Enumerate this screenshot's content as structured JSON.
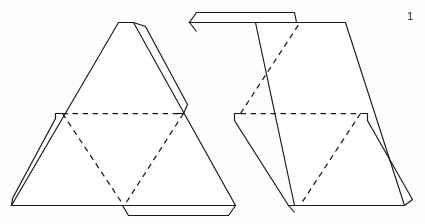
{
  "page": {
    "number_label": "1",
    "background_color": "#fdfdfc",
    "ink_color": "#1a1a1a"
  },
  "figure": {
    "title": "",
    "caption": "",
    "kind": "papercraft-net-line-drawing",
    "line_styles": {
      "cut_label": "solid",
      "fold_label": "dashed"
    },
    "nets": [
      {
        "name": "left-triangle-net",
        "outline_label": "large upright triangle",
        "tabs": [
          {
            "name": "apex-right-strip-tab",
            "edge_label": "upper right edge"
          },
          {
            "name": "lower-left-strip-tab",
            "edge_label": "lower left edge"
          },
          {
            "name": "bottom-trapezoid-tab",
            "edge_label": "bottom edge"
          }
        ],
        "fold_lines": [
          {
            "name": "horizontal-fold",
            "orientation_label": "horizontal"
          },
          {
            "name": "left-diagonal-fold",
            "orientation_label": "diagonal"
          },
          {
            "name": "right-diagonal-fold",
            "orientation_label": "diagonal"
          }
        ]
      },
      {
        "name": "right-rhombus-net",
        "outline_label": "rhombus of two triangles",
        "tabs": [
          {
            "name": "top-trapezoid-tab",
            "edge_label": "top edge"
          },
          {
            "name": "lower-left-strip-tab",
            "edge_label": "lower left edge"
          },
          {
            "name": "lower-right-strip-tab",
            "edge_label": "lower right edge"
          }
        ],
        "fold_lines": [
          {
            "name": "horizontal-fold",
            "orientation_label": "horizontal"
          },
          {
            "name": "upper-left-diagonal-fold",
            "orientation_label": "diagonal"
          },
          {
            "name": "lower-right-diagonal-fold",
            "orientation_label": "diagonal"
          }
        ]
      }
    ]
  }
}
